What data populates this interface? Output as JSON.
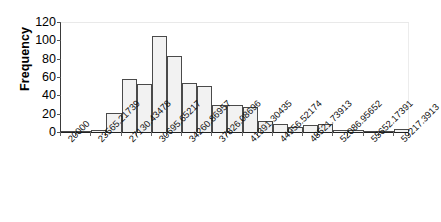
{
  "chart_data": {
    "type": "bar",
    "title": "",
    "subtitle": "",
    "xlabel": "",
    "ylabel": "Frequency",
    "ylim": [
      0,
      120
    ],
    "y_ticks": [
      0,
      20,
      40,
      60,
      80,
      100,
      120
    ],
    "grid": "horizontal-top-only",
    "legend": "none",
    "bar_style": "histogram-adjacent-bars",
    "bin_width": 3565.21739,
    "categories": [
      "20000",
      "21782.608695",
      "23565.21739",
      "25347.826085",
      "27130.43478",
      "28913.043475",
      "30695.65217",
      "32478.260865",
      "34260.86957",
      "36043.478265",
      "37826.08696",
      "39608.695655",
      "41391.30435",
      "43173.913045",
      "44956.52174",
      "46739.130435",
      "48521.73913",
      "50304.347825",
      "52086.95652",
      "53869.565215",
      "55652.17391",
      "57434.782605",
      "59217.3913"
    ],
    "values": [
      1,
      1,
      2,
      21,
      58,
      52,
      105,
      83,
      53,
      50,
      29,
      29,
      27,
      12,
      9,
      5,
      8,
      9,
      2,
      2,
      1,
      1,
      3
    ],
    "axis_tick_labels": [
      "20000",
      "23565.21739",
      "27130.43478",
      "30695.65217",
      "34260.86957",
      "37826.08696",
      "41391.30435",
      "44956.52174",
      "48521.73913",
      "52086.95652",
      "55652.17391",
      "59217.3913"
    ],
    "colors": {
      "bar_fill": "#f2f2f2",
      "bar_border": "#4a4a4a",
      "axis": "#222222",
      "gridline": "#e9e9e9",
      "text": "#000000"
    }
  }
}
